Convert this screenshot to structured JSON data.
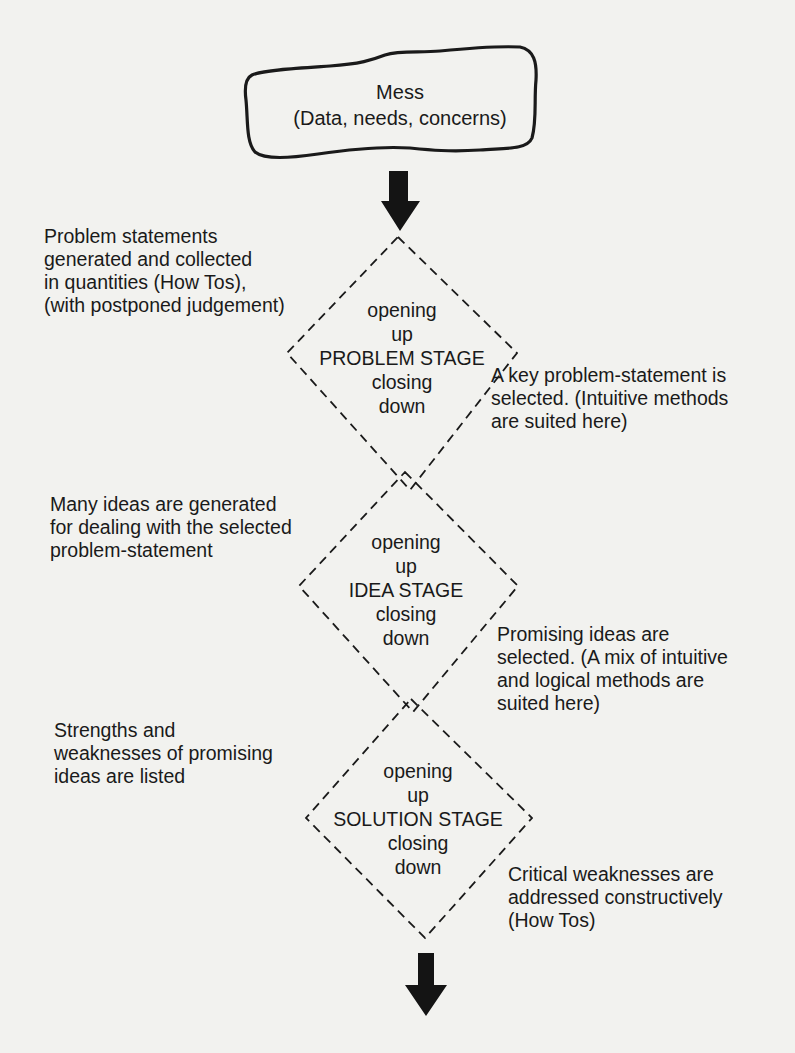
{
  "diagram": {
    "start": {
      "title": "Mess",
      "subtitle": "(Data, needs, concerns)"
    },
    "stages": [
      {
        "opening_1": "opening",
        "opening_2": "up",
        "name": "PROBLEM STAGE",
        "closing_1": "closing",
        "closing_2": "down",
        "left_note": [
          "Problem statements",
          "generated and collected",
          "in quantities (How Tos),",
          "(with postponed judgement)"
        ],
        "right_note": [
          "A key problem-statement is",
          "selected. (Intuitive methods",
          "are suited here)"
        ]
      },
      {
        "opening_1": "opening",
        "opening_2": "up",
        "name": "IDEA STAGE",
        "closing_1": "closing",
        "closing_2": "down",
        "left_note": [
          "Many ideas are generated",
          "for dealing with the selected",
          "problem-statement"
        ],
        "right_note": [
          "Promising ideas are",
          "selected. (A mix of intuitive",
          "and logical methods are",
          "suited here)"
        ]
      },
      {
        "opening_1": "opening",
        "opening_2": "up",
        "name": "SOLUTION STAGE",
        "closing_1": "closing",
        "closing_2": "down",
        "left_note": [
          "Strengths and",
          "weaknesses of promising",
          "ideas are listed"
        ],
        "right_note": [
          "Critical weaknesses are",
          "addressed constructively",
          "(How Tos)"
        ]
      }
    ],
    "colors": {
      "paper": "#f2f2ef",
      "ink": "#1a1a1a"
    }
  }
}
